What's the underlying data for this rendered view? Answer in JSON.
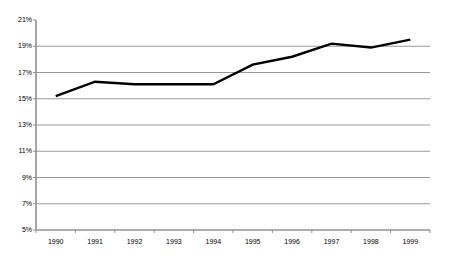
{
  "chart_data": {
    "type": "line",
    "title": "",
    "xlabel": "",
    "ylabel": "",
    "categories": [
      "1990",
      "1991",
      "1992",
      "1993",
      "1994",
      "1995",
      "1996",
      "1997",
      "1998",
      "1999"
    ],
    "values": [
      15.2,
      16.3,
      16.1,
      16.1,
      16.1,
      17.6,
      18.2,
      19.2,
      18.9,
      19.5
    ],
    "series": [
      {
        "name": "",
        "values": [
          15.2,
          16.3,
          16.1,
          16.1,
          16.1,
          17.6,
          18.2,
          19.2,
          18.9,
          19.5
        ]
      }
    ],
    "ylim": [
      5,
      21
    ],
    "ytick_labels": [
      "21%",
      "19%",
      "17%",
      "15%",
      "13%",
      "11%",
      "9%",
      "7%",
      "5%"
    ],
    "ytick_values": [
      21,
      19,
      17,
      15,
      13,
      11,
      9,
      7,
      5
    ],
    "xtick_labels": [
      "1990",
      "1991",
      "1992",
      "1993",
      "1994",
      "1995",
      "1996",
      "1997",
      "1998",
      "1999"
    ],
    "grid": "horizontal",
    "gridlines_at": [
      19,
      17,
      15,
      13,
      11,
      9,
      7,
      5
    ],
    "legend": "none",
    "legend_position": "none",
    "line_color": "#000000",
    "grid_color": "#999999",
    "axis_color": "#808080",
    "background_color": "#ffffff"
  },
  "layout": {
    "plot_left": 36,
    "plot_right": 430,
    "plot_top": 20,
    "plot_bottom": 230
  }
}
